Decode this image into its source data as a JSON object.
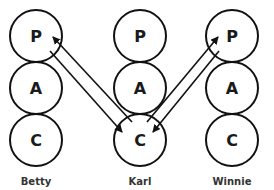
{
  "diagram": {
    "colors": {
      "stroke": "#111111",
      "text": "#1a1a1a",
      "background": "#ffffff"
    },
    "ego_state_labels": {
      "parent": "P",
      "adult": "A",
      "child": "C"
    },
    "people": [
      {
        "name": "Betty",
        "states": [
          "P",
          "A",
          "C"
        ]
      },
      {
        "name": "Karl",
        "states": [
          "P",
          "A",
          "C"
        ]
      },
      {
        "name": "Winnie",
        "states": [
          "P",
          "A",
          "C"
        ]
      }
    ],
    "transactions": [
      {
        "from": "Karl.C",
        "to": "Betty.P",
        "direction": "up"
      },
      {
        "from": "Betty.P",
        "to": "Karl.C",
        "direction": "down"
      },
      {
        "from": "Karl.C",
        "to": "Winnie.P",
        "direction": "up"
      },
      {
        "from": "Winnie.P",
        "to": "Karl.C",
        "direction": "down"
      }
    ]
  }
}
